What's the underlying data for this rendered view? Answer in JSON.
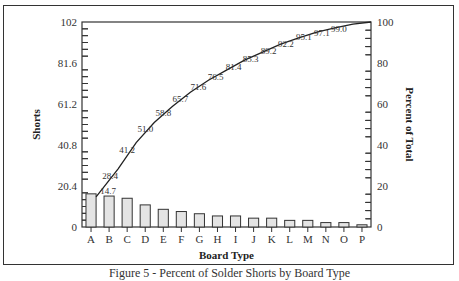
{
  "chart_data": {
    "type": "bar",
    "subtype": "pareto",
    "title": "",
    "caption": "Figure 5 - Percent of Solder Shorts by Board Type",
    "xlabel": "Board Type",
    "ylabel": "Shorts",
    "y2label": "Percent of Total",
    "categories": [
      "A",
      "B",
      "C",
      "D",
      "E",
      "F",
      "G",
      "H",
      "I",
      "J",
      "K",
      "L",
      "M",
      "N",
      "O",
      "P"
    ],
    "series": [
      {
        "name": "Shorts",
        "type": "bar",
        "axis": "left",
        "values": [
          15,
          14,
          13,
          10,
          8,
          7,
          6,
          5,
          5,
          4,
          4,
          3,
          3,
          2,
          2,
          1
        ]
      },
      {
        "name": "Cumulative Percent",
        "type": "line",
        "axis": "right",
        "values": [
          14.7,
          28.4,
          41.2,
          51.0,
          58.8,
          65.7,
          71.6,
          76.5,
          81.4,
          85.3,
          89.2,
          92.2,
          95.1,
          97.1,
          99.0,
          100.0
        ],
        "labels": [
          "14.7",
          "28.4",
          "41.2",
          "51.0",
          "58.8",
          "65.7",
          "71.6",
          "76.5",
          "81.4",
          "85.3",
          "89.2",
          "92.2",
          "95.1",
          "97.1",
          "99.0",
          ""
        ]
      }
    ],
    "ylim": [
      0,
      102
    ],
    "y2lim": [
      0,
      100
    ],
    "yticks": [
      "0",
      "20.4",
      "40.8",
      "61.2",
      "81.6",
      "102"
    ],
    "y2ticks": [
      "0",
      "20",
      "40",
      "60",
      "80",
      "100"
    ],
    "grid": false,
    "legend": "none",
    "colors": {
      "bar_fill": "#e4e4e4",
      "bar_stroke": "#333333",
      "line": "#222222"
    }
  }
}
